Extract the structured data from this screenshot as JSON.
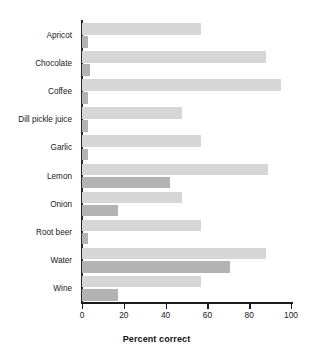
{
  "chart_data": {
    "type": "bar",
    "orientation": "horizontal",
    "title": "",
    "xlabel": "Percent correct",
    "ylabel": "",
    "xlim": [
      0,
      100
    ],
    "xticks": [
      0,
      20,
      40,
      60,
      80,
      100
    ],
    "xtick_labels": [
      "0",
      "20",
      "40",
      "60",
      "80",
      "100"
    ],
    "grid": false,
    "legend": "none",
    "categories": [
      "Apricot",
      "Chocolate",
      "Coffee",
      "Dill pickle juice",
      "Garlic",
      "Lemon",
      "Onion",
      "Root beer",
      "Water",
      "Wine"
    ],
    "series": [
      {
        "name": "series-light",
        "color": "#d6d6d6",
        "values": [
          57,
          88,
          95,
          48,
          57,
          89,
          48,
          57,
          88,
          57
        ]
      },
      {
        "name": "series-dark",
        "color": "#b3b3b3",
        "values": [
          3,
          4,
          3,
          3,
          3,
          42,
          17,
          3,
          71,
          17
        ]
      }
    ]
  },
  "colors": {
    "background": "#ffffff",
    "axis": "#1a1a1a",
    "bar_light": "#d6d6d6",
    "bar_dark": "#b3b3b3",
    "text": "#1a1a1a"
  }
}
